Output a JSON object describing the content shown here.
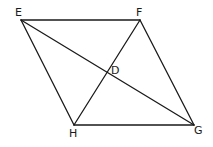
{
  "diagram": {
    "type": "parallelogram-with-diagonals",
    "points": {
      "E": {
        "x": 21,
        "y": 20,
        "label": "E",
        "lx": 15,
        "ly": 16
      },
      "F": {
        "x": 140,
        "y": 20,
        "label": "F",
        "lx": 136,
        "ly": 16
      },
      "H": {
        "x": 74,
        "y": 125,
        "label": "H",
        "lx": 69,
        "ly": 137
      },
      "G": {
        "x": 194,
        "y": 125,
        "label": "G",
        "lx": 194,
        "ly": 134
      },
      "D": {
        "x": 107,
        "y": 72,
        "label": "D",
        "lx": 111,
        "ly": 74
      }
    },
    "edges": [
      [
        "E",
        "F"
      ],
      [
        "F",
        "G"
      ],
      [
        "G",
        "H"
      ],
      [
        "H",
        "E"
      ],
      [
        "E",
        "G"
      ],
      [
        "F",
        "H"
      ]
    ],
    "stroke_color": "#1a1a1a"
  }
}
